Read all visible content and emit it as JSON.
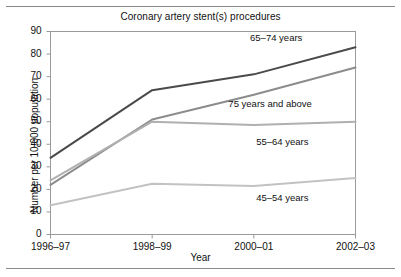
{
  "figure": {
    "title": "Coronary artery stent(s) procedures",
    "top_rule": "horizontal-rule",
    "bottom_rule": "horizontal-rule"
  },
  "chart_data": {
    "type": "line",
    "title": "Coronary artery stent(s) procedures",
    "xlabel": "Year",
    "ylabel": "Number per 10,000 population",
    "categories": [
      "1996–97",
      "1998–99",
      "2000–01",
      "2002–03"
    ],
    "x_tick_labels": [
      "1996–97",
      "1998–99",
      "2000–01",
      "2002–03"
    ],
    "y_tick_labels": [
      "0",
      "10",
      "20",
      "30",
      "40",
      "50",
      "60",
      "70",
      "80",
      "90"
    ],
    "y_ticks": [
      0,
      10,
      20,
      30,
      40,
      50,
      60,
      70,
      80,
      90
    ],
    "ylim": [
      0,
      90
    ],
    "grid": false,
    "legend": "inline-labels",
    "series": [
      {
        "name": "65–74 years",
        "color": "#4a4a4a",
        "values": [
          34,
          64,
          71,
          83
        ],
        "label_x_pct": 74,
        "label_y_value": 87
      },
      {
        "name": "75 years and above",
        "color": "#8c8c8c",
        "values": [
          22,
          51,
          62,
          74
        ],
        "label_x_pct": 72,
        "label_y_value": 58
      },
      {
        "name": "55–64 years",
        "color": "#b0b0b0",
        "values": [
          24,
          50,
          48.5,
          50
        ],
        "label_x_pct": 76,
        "label_y_value": 41
      },
      {
        "name": "45–54 years",
        "color": "#c2c2c2",
        "values": [
          13,
          22.5,
          21.5,
          25
        ],
        "label_x_pct": 76,
        "label_y_value": 16
      }
    ]
  }
}
